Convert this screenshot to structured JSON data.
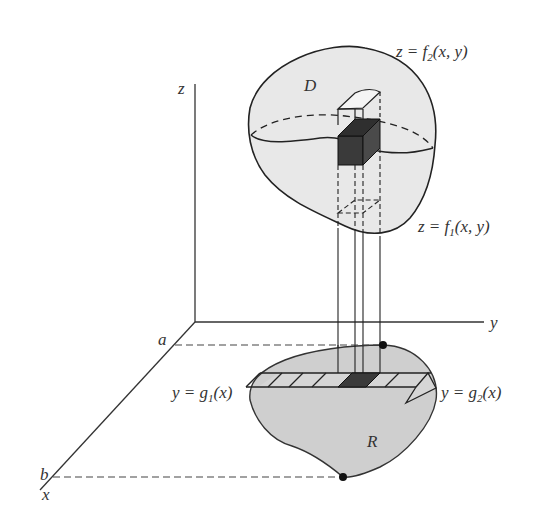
{
  "figure": {
    "colors": {
      "solid_fill": "#e8e8e8",
      "region_fill": "#cfcfcf",
      "stroke": "#222222",
      "box_fill": "#3a3a3a",
      "text": "#333333"
    },
    "axes": {
      "z_label": "z",
      "y_label": "y",
      "x_label": "x"
    },
    "bounds": {
      "a_label": "a",
      "b_label": "b"
    },
    "solid": {
      "label": "D",
      "top_surface": {
        "prefix": "z = f",
        "sub": "2",
        "suffix": "(x, y)"
      },
      "bottom_surface": {
        "prefix": "z = f",
        "sub": "1",
        "suffix": "(x, y)"
      }
    },
    "region": {
      "label": "R",
      "lower_curve": {
        "prefix": "y = g",
        "sub": "1",
        "suffix": "(x)"
      },
      "upper_curve": {
        "prefix": "y = g",
        "sub": "2",
        "suffix": "(x)"
      }
    }
  }
}
